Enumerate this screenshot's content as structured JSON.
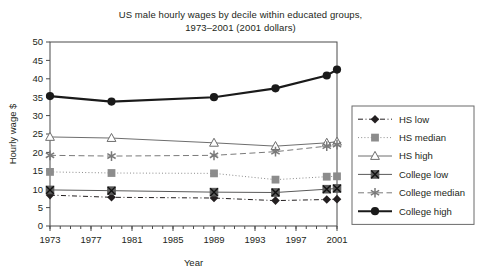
{
  "chart_data": {
    "type": "line",
    "title": "US male hourly wages  by decile within educated groups,",
    "subtitle": "1973–2001 (2001 dollars)",
    "xlabel": "Year",
    "ylabel": "Hourly wage $",
    "xlim": [
      1973,
      2001
    ],
    "ylim": [
      0,
      50
    ],
    "yticks": [
      0,
      5,
      10,
      15,
      20,
      25,
      30,
      35,
      40,
      45,
      50
    ],
    "ytick_labels": [
      "0",
      "5",
      "10",
      "15",
      "20",
      "25",
      "30",
      "35",
      "40",
      "45",
      "50"
    ],
    "xticks": [
      1973,
      1977,
      1981,
      1985,
      1989,
      1993,
      1997,
      2001
    ],
    "xtick_labels": [
      "1973",
      "1977",
      "1981",
      "1985",
      "1989",
      "1993",
      "1997",
      "2001"
    ],
    "x_minor_tick_interval": 1,
    "grid": false,
    "legend_position": "right",
    "x": [
      1973,
      1979,
      1989,
      1995,
      2000,
      2001
    ],
    "series": [
      {
        "name": "HS low",
        "values": [
          8.4,
          7.8,
          7.6,
          6.9,
          7.2,
          7.3
        ],
        "marker": "filled-diamond",
        "line_style": "dash-dot",
        "color": "#231f20"
      },
      {
        "name": "HS median",
        "values": [
          14.7,
          14.4,
          14.3,
          12.6,
          13.4,
          13.5
        ],
        "marker": "filled-square",
        "line_style": "dotted",
        "color": "#8c8c8c"
      },
      {
        "name": "HS high",
        "values": [
          24.2,
          23.9,
          22.6,
          21.7,
          22.6,
          22.9
        ],
        "marker": "open-triangle",
        "line_style": "solid",
        "color": "#6e6e6e"
      },
      {
        "name": "College low",
        "values": [
          9.8,
          9.6,
          9.2,
          9.1,
          10.0,
          10.2
        ],
        "marker": "square-with-x",
        "line_style": "solid",
        "color": "#5a5a5a"
      },
      {
        "name": "College median",
        "values": [
          19.2,
          19.0,
          19.2,
          20.2,
          21.7,
          22.1
        ],
        "marker": "asterisk",
        "line_style": "dashed",
        "color": "#7a7a7a"
      },
      {
        "name": "College high",
        "values": [
          35.3,
          33.8,
          35.0,
          37.4,
          40.9,
          42.5
        ],
        "marker": "filled-circle",
        "line_style": "thick-solid",
        "color": "#1a1a1a"
      }
    ]
  }
}
